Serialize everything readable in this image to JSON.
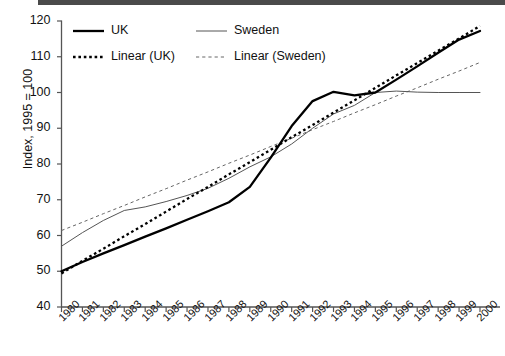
{
  "chart_data": {
    "type": "line",
    "title": "",
    "xlabel": "",
    "ylabel": "Index, 1995 = 100",
    "xlim": [
      1980,
      2000
    ],
    "ylim": [
      40,
      120
    ],
    "yticks": [
      40,
      50,
      60,
      70,
      80,
      90,
      100,
      110,
      120
    ],
    "grid": false,
    "legend_position": "top-left",
    "x": [
      1980,
      1981,
      1982,
      1983,
      1984,
      1985,
      1986,
      1987,
      1988,
      1989,
      1990,
      1991,
      1992,
      1993,
      1994,
      1995,
      1996,
      1997,
      1998,
      1999,
      2000
    ],
    "categories": [
      "1980",
      "1981",
      "1982",
      "1983",
      "1984",
      "1985",
      "1986",
      "1987",
      "1988",
      "1989",
      "1990",
      "1991",
      "1992",
      "1993",
      "1994",
      "1995",
      "1996",
      "1997",
      "1998",
      "1999",
      "2000"
    ],
    "series": [
      {
        "name": "UK",
        "style": "solid",
        "width": "thick",
        "color": "#000000",
        "values": [
          50.0,
          52.6,
          55.0,
          57.3,
          59.7,
          62.0,
          64.4,
          66.8,
          69.3,
          73.6,
          81.8,
          90.6,
          97.6,
          100.2,
          99.2,
          100.0,
          103.6,
          107.3,
          111.1,
          114.8,
          117.2
        ]
      },
      {
        "name": "Sweden",
        "style": "solid",
        "width": "thin",
        "color": "#555555",
        "values": [
          57.0,
          60.8,
          64.2,
          67.0,
          68.0,
          69.5,
          71.2,
          73.2,
          76.0,
          79.2,
          82.0,
          85.6,
          90.0,
          94.0,
          96.4,
          100.0,
          100.4,
          100.1,
          100.0,
          100.0,
          100.0
        ]
      },
      {
        "name": "Linear (UK)",
        "style": "dashed",
        "width": "thick",
        "color": "#000000",
        "values": [
          49.4,
          52.9,
          56.3,
          59.8,
          63.2,
          66.7,
          70.2,
          73.6,
          77.1,
          80.5,
          84.0,
          87.5,
          90.9,
          94.4,
          97.8,
          101.3,
          104.8,
          108.2,
          111.7,
          115.1,
          118.6
        ]
      },
      {
        "name": "Linear (Sweden)",
        "style": "dashed",
        "width": "thin",
        "color": "#666666",
        "values": [
          61.4,
          63.7,
          66.1,
          68.4,
          70.8,
          73.1,
          75.5,
          77.8,
          80.2,
          82.5,
          84.9,
          87.2,
          89.6,
          91.9,
          94.3,
          96.6,
          99.0,
          101.3,
          103.7,
          106.0,
          108.4
        ]
      }
    ],
    "legend": [
      {
        "label": "UK",
        "style": "solid",
        "width": "thick"
      },
      {
        "label": "Sweden",
        "style": "solid",
        "width": "thin"
      },
      {
        "label": "Linear (UK)",
        "style": "dashed",
        "width": "thick"
      },
      {
        "label": "Linear (Sweden)",
        "style": "dashed",
        "width": "thin"
      }
    ]
  }
}
